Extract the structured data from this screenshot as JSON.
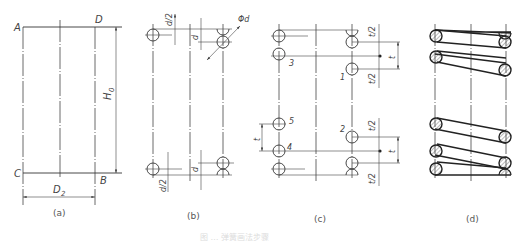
{
  "figure": {
    "panels": [
      {
        "id": "a",
        "caption": "(a)",
        "point_labels": [
          "A",
          "D",
          "C",
          "B"
        ],
        "dimensions": {
          "height": "H0",
          "height_main": "H",
          "height_sub": "0",
          "diameter": "D2",
          "diameter_main": "D",
          "diameter_sub": "2"
        }
      },
      {
        "id": "b",
        "caption": "(b)",
        "dimensions": [
          "d/2",
          "d",
          "Φd",
          "d/2",
          "d"
        ],
        "top_half_label": "d/2",
        "top_wire_label": "d",
        "phi_label": "Φd",
        "bottom_half_label": "d/2",
        "bottom_wire_label": "d"
      },
      {
        "id": "c",
        "caption": "(c)",
        "coil_numbers": [
          "1",
          "2",
          "3",
          "4",
          "5"
        ],
        "dimensions": [
          "t/2",
          "t",
          "t/2",
          "t/2",
          "t",
          "t/2",
          "t"
        ],
        "half_pitch_label": "t/2",
        "pitch_label": "t"
      },
      {
        "id": "d",
        "caption": "(d)"
      }
    ],
    "bottom_caption": "图 … 弹簧画法步骤"
  },
  "colors": {
    "line": "#333333",
    "background": "#ffffff"
  }
}
